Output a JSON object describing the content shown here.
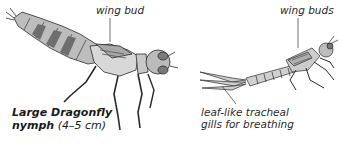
{
  "figure": {
    "left": {
      "name_line1": "Large Dragonfly",
      "name_line2": "nymph",
      "size": "(4–5 cm)",
      "callout": "wing bud"
    },
    "right": {
      "callout_top": "wing buds",
      "callout_bottom_line1": "leaf-like tracheal",
      "callout_bottom_line2": "gills for breathing"
    }
  },
  "colors": {
    "ink": "#2a2a2a",
    "shade": "#9a9a9a",
    "fill": "#d8d8d8",
    "background": "#ffffff"
  }
}
